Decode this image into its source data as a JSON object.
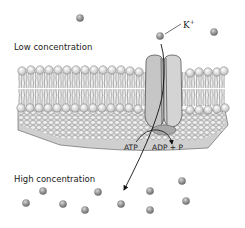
{
  "diagram": {
    "labels": {
      "low_concentration": "Low concentration",
      "high_concentration": "High concentration",
      "ion": "K",
      "ion_charge": "+",
      "atp": "ATP",
      "adp": "ADP + P"
    },
    "colors": {
      "ion": "#8a8a8a",
      "membrane_head": "#e8e8e8",
      "protein": "#c8c8c8",
      "cytoplasm": "#d0d0d0",
      "arrow": "#111111"
    },
    "ions_top": [
      {
        "x": 80,
        "y": 18
      },
      {
        "x": 160,
        "y": 36
      },
      {
        "x": 214,
        "y": 32
      }
    ],
    "ions_bottom": [
      {
        "x": 43,
        "y": 191
      },
      {
        "x": 26,
        "y": 203
      },
      {
        "x": 63,
        "y": 204
      },
      {
        "x": 98,
        "y": 192
      },
      {
        "x": 85,
        "y": 210
      },
      {
        "x": 121,
        "y": 204
      },
      {
        "x": 150,
        "y": 191
      },
      {
        "x": 150,
        "y": 210
      },
      {
        "x": 182,
        "y": 181
      },
      {
        "x": 186,
        "y": 201
      }
    ]
  }
}
